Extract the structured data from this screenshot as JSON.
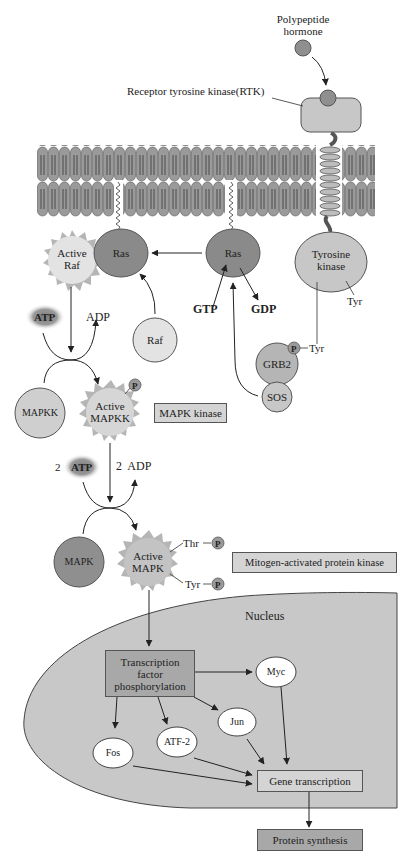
{
  "diagram": {
    "colors": {
      "membrane_head": "#9a9a9a",
      "dark_protein": "#8a8a8a",
      "light_protein": "#cfcfcf",
      "medium_protein": "#b5b5b5",
      "nucleus": "#c8c8c8",
      "label_box": "#d4d4d4",
      "protein_synthesis_box": "#a8a8a8",
      "white_node": "#ffffff"
    },
    "labels": {
      "hormone": "Polypeptide\nhormone",
      "hormone_line1": "Polypeptide",
      "hormone_line2": "hormone",
      "rtk": "Receptor tyrosine kinase(RTK)",
      "active_raf_1": "Active",
      "active_raf_2": "Raf",
      "ras_left": "Ras",
      "ras_right": "Ras",
      "tyrosine_kinase_1": "Tyrosine",
      "tyrosine_kinase_2": "kinase",
      "tyr_1": "Tyr",
      "gtp": "GTP",
      "gdp": "GDP",
      "atp_1": "ATP",
      "adp_1": "ADP",
      "raf": "Raf",
      "grb2": "GRB2",
      "p_grb2": "P",
      "tyr_2": "Tyr",
      "sos": "SOS",
      "mapkk": "MAPKK",
      "active_mapkk_1": "Active",
      "active_mapkk_2": "MAPKK",
      "p_mapkk": "P",
      "mapk_kinase_box": "MAPK kinase",
      "two_1": "2",
      "atp_2": "ATP",
      "adp_2": "2  ADP",
      "mapk": "MAPK",
      "active_mapk_1": "Active",
      "active_mapk_2": "MAPK",
      "thr": "Thr",
      "tyr_3": "Tyr",
      "p_thr": "P",
      "p_tyr": "P",
      "mitogen_box": "Mitogen-activated protein kinase",
      "nucleus": "Nucleus",
      "tf_1": "Transcription",
      "tf_2": "factor",
      "tf_3": "phosphorylation",
      "myc": "Myc",
      "jun": "Jun",
      "atf2": "ATF-2",
      "fos": "Fos",
      "gene_transcription": "Gene transcription",
      "protein_synthesis": "Protein synthesis"
    }
  }
}
